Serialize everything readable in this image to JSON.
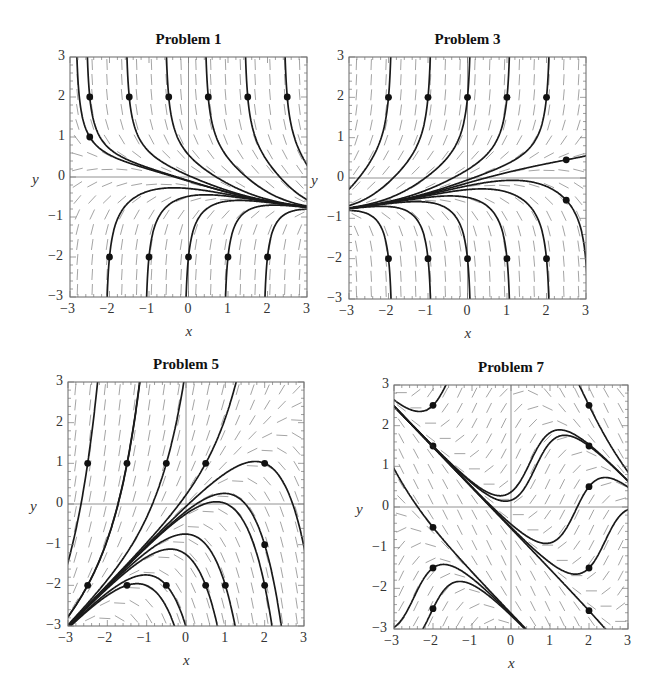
{
  "chart_data": [
    {
      "type": "direction_field",
      "title": "Problem 1",
      "xlabel": "x",
      "ylabel": "y",
      "xlim": [
        -3,
        3
      ],
      "ylim": [
        -3,
        3
      ],
      "xticks": [
        -3,
        -2,
        -1,
        0,
        1,
        2,
        3
      ],
      "yticks": [
        -3,
        -2,
        -1,
        0,
        1,
        2,
        3
      ],
      "slope_field": "negative slopes above ~y=0.5, positive below; curves converge to y≈-0.7 at x=3",
      "initial_points": [
        [
          -2.5,
          2
        ],
        [
          -1.5,
          2
        ],
        [
          -0.5,
          2
        ],
        [
          0.5,
          2
        ],
        [
          1.5,
          2
        ],
        [
          2.5,
          2
        ],
        [
          -2.5,
          1
        ],
        [
          -2,
          -2
        ],
        [
          -1,
          -2
        ],
        [
          0,
          -2
        ],
        [
          1,
          -2
        ],
        [
          2,
          -2
        ]
      ],
      "box": [
        70,
        57,
        307,
        297
      ]
    },
    {
      "type": "direction_field",
      "title": "Problem 3",
      "xlabel": "x",
      "ylabel": "y",
      "xlim": [
        -3,
        3
      ],
      "ylim": [
        -3,
        3
      ],
      "xticks": [
        -3,
        -2,
        -1,
        0,
        1,
        2,
        3
      ],
      "yticks": [
        -3,
        -2,
        -1,
        0,
        1,
        2,
        3
      ],
      "slope_field": "positive slopes above, negative below; curves converge to y≈-0.7 at x=-3",
      "initial_points": [
        [
          -2,
          2
        ],
        [
          -1,
          2
        ],
        [
          0,
          2
        ],
        [
          1,
          2
        ],
        [
          2,
          2
        ],
        [
          2.5,
          0.45
        ],
        [
          2.5,
          -0.55
        ],
        [
          -2,
          -2
        ],
        [
          -1,
          -2
        ],
        [
          0,
          -2
        ],
        [
          1,
          -2
        ],
        [
          2,
          -2
        ]
      ],
      "box": [
        349,
        57,
        586,
        299
      ]
    },
    {
      "type": "direction_field",
      "title": "Problem 5",
      "xlabel": "x",
      "ylabel": "y",
      "xlim": [
        -3,
        3
      ],
      "ylim": [
        -3,
        3
      ],
      "xticks": [
        -3,
        -2,
        -1,
        0,
        1,
        2,
        3
      ],
      "yticks": [
        -3,
        -2,
        -1,
        0,
        1,
        2,
        3
      ],
      "slope_field": "curves emanate from (-3,-3); line y=x separatrix",
      "initial_points": [
        [
          -2.5,
          1
        ],
        [
          -1.5,
          1
        ],
        [
          -0.5,
          1
        ],
        [
          0.5,
          1
        ],
        [
          2,
          1
        ],
        [
          2,
          -1
        ],
        [
          -2.5,
          -2
        ],
        [
          -1.5,
          -2
        ],
        [
          -0.5,
          -2
        ],
        [
          0.5,
          -2
        ],
        [
          1,
          -2
        ],
        [
          2,
          -2
        ]
      ],
      "box": [
        68,
        382,
        304,
        626
      ]
    },
    {
      "type": "direction_field",
      "title": "Problem 7",
      "xlabel": "x",
      "ylabel": "y",
      "xlim": [
        -3,
        3
      ],
      "ylim": [
        -3,
        3
      ],
      "xticks": [
        -3,
        -2,
        -1,
        0,
        1,
        2,
        3
      ],
      "yticks": [
        -3,
        -2,
        -1,
        0,
        1,
        2,
        3
      ],
      "slope_field": "oscillating S-shaped solution curves",
      "initial_points": [
        [
          -2,
          2.5
        ],
        [
          -2,
          1.5
        ],
        [
          2,
          2.5
        ],
        [
          2,
          1.5
        ],
        [
          2,
          0.5
        ],
        [
          -2,
          -0.5
        ],
        [
          -2,
          -1.5
        ],
        [
          -2,
          -2.5
        ],
        [
          2,
          -1.5
        ],
        [
          2,
          -2.55
        ]
      ],
      "box": [
        394,
        385,
        628,
        629
      ]
    }
  ]
}
